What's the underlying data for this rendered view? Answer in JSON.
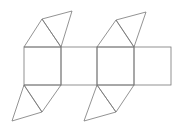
{
  "diagram": {
    "stroke_color": "#777777",
    "background": "#ffffff",
    "squares": [
      {
        "x": 24,
        "y": 47,
        "w": 37,
        "h": 38
      },
      {
        "x": 61,
        "y": 47,
        "w": 36,
        "h": 38
      },
      {
        "x": 97,
        "y": 47,
        "w": 37,
        "h": 38
      },
      {
        "x": 134,
        "y": 47,
        "w": 37,
        "h": 38
      }
    ],
    "triangles": [
      {
        "points": "24,47 42,19 61,47"
      },
      {
        "points": "42,19 72,11 61,47"
      },
      {
        "points": "97,47 116,20 134,47"
      },
      {
        "points": "116,20 146,12 134,47"
      },
      {
        "points": "24,85 42,112 61,85"
      },
      {
        "points": "24,85 12,121 42,112"
      },
      {
        "points": "97,85 116,112 134,85"
      },
      {
        "points": "97,85 84,121 116,112"
      }
    ]
  }
}
